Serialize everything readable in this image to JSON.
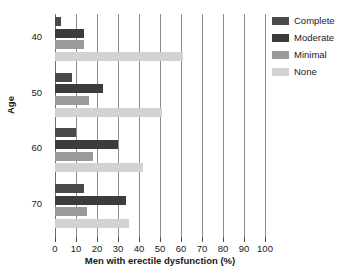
{
  "chart_data": {
    "type": "bar",
    "orientation": "horizontal",
    "title": "",
    "xlabel": "Men with erectile dysfunction (%)",
    "ylabel": "Age",
    "xlim": [
      0,
      100
    ],
    "xticks": [
      0,
      10,
      20,
      30,
      40,
      50,
      60,
      70,
      80,
      90,
      100
    ],
    "grid": "vertical",
    "legend_position": "right",
    "categories": [
      "40",
      "50",
      "60",
      "70"
    ],
    "series": [
      {
        "name": "Complete",
        "color": "#4a4a4a",
        "values": [
          3,
          8,
          10,
          14
        ]
      },
      {
        "name": "Moderate",
        "color": "#3c3c3c",
        "values": [
          14,
          23,
          30,
          34
        ]
      },
      {
        "name": "Minimal",
        "color": "#9a9a9a",
        "values": [
          14,
          16,
          18,
          15
        ]
      },
      {
        "name": "None",
        "color": "#d2d2d2",
        "values": [
          61,
          51,
          42,
          35
        ]
      }
    ]
  },
  "legend": {
    "items": [
      {
        "label": "Complete",
        "color": "#4a4a4a"
      },
      {
        "label": "Moderate",
        "color": "#3c3c3c"
      },
      {
        "label": "Minimal",
        "color": "#9a9a9a"
      },
      {
        "label": "None",
        "color": "#d2d2d2"
      }
    ]
  },
  "axes": {
    "x_title": "Men with erectile dysfunction (%)",
    "y_title": "Age",
    "x_tick_labels": [
      "0",
      "10",
      "20",
      "30",
      "40",
      "50",
      "60",
      "70",
      "80",
      "90",
      "100"
    ],
    "y_tick_labels": [
      "40",
      "50",
      "60",
      "70"
    ]
  }
}
